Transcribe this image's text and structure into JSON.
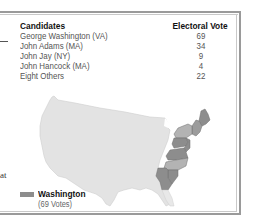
{
  "table": {
    "headers": {
      "candidate": "Candidates",
      "vote": "Electoral Vote"
    },
    "rows": [
      {
        "candidate": "George Washington (VA)",
        "vote": "69"
      },
      {
        "candidate": "John Adams (MA)",
        "vote": "34"
      },
      {
        "candidate": "John Jay (NY)",
        "vote": "9"
      },
      {
        "candidate": "John Hancock (MA)",
        "vote": "4"
      },
      {
        "candidate": "Eight Others",
        "vote": "22"
      }
    ]
  },
  "legend": {
    "label": "Washington",
    "sublabel": "(69 Votes)",
    "color": "#8d8d8d"
  },
  "left_fragment": {
    "text": "at"
  },
  "colors": {
    "map_land": "#e3e3e3",
    "washington_states": "#8d8d8d",
    "other_states_light": "#b3b3b3",
    "frame": "#9a9a9a"
  }
}
